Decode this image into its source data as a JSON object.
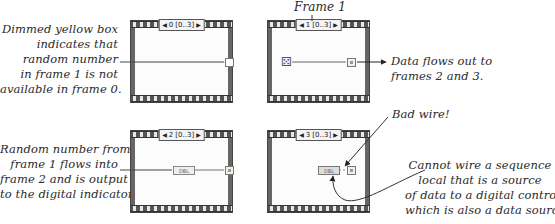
{
  "title_label": "Frame 1",
  "frames": [
    {
      "index": "0",
      "range": "[0..3]",
      "contents": "dimmed output tunnel"
    },
    {
      "index": "1",
      "range": "[0..3]",
      "contents": "random number function wired to sequence local"
    },
    {
      "index": "2",
      "range": "[0..3]",
      "contents": "sequence local wired to DBL digital indicator"
    },
    {
      "index": "3",
      "range": "[0..3]",
      "contents": "DBL digital control with broken wire to sequence local"
    }
  ],
  "terminal_label": "DBL",
  "annotations": {
    "dimmed": [
      "Dimmed yellow box",
      "indicates that",
      "random number",
      "in frame 1 is not",
      "available in frame 0."
    ],
    "flows_out": [
      "Data flows out to",
      "frames 2 and 3."
    ],
    "bad_wire": "Bad wire!",
    "random_flows": [
      "Random number from",
      "frame 1 flows into",
      "frame 2 and is output",
      "to the digital indicator."
    ],
    "cannot_wire": [
      "Cannot wire a sequence",
      "local that is a source",
      "of data to a digital control",
      "which is also a data source."
    ]
  },
  "colors": {
    "frame_border": "#444444",
    "wire": "#555555",
    "bad_wire": "#777777"
  }
}
